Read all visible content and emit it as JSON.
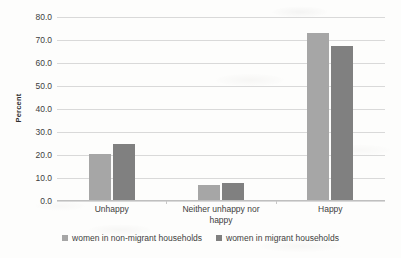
{
  "chart_data": {
    "type": "bar",
    "title": "",
    "xlabel": "",
    "ylabel": "Percent",
    "ylim": [
      0,
      80
    ],
    "ytick_step": 10,
    "ytick_labels": [
      "0.0",
      "10.0",
      "20.0",
      "30.0",
      "40.0",
      "50.0",
      "60.0",
      "70.0",
      "80.0"
    ],
    "grid": true,
    "legend_position": "bottom-center",
    "categories": [
      "Unhappy",
      "Neither unhappy nor happy",
      "Happy"
    ],
    "category_display_lines": [
      [
        "Unhappy"
      ],
      [
        "Neither unhappy nor",
        "happy"
      ],
      [
        "Happy"
      ]
    ],
    "series": [
      {
        "name": "women in non-migrant households",
        "color": "#a6a6a6",
        "values": [
          19.8,
          6.4,
          72.7
        ]
      },
      {
        "name": "women in migrant households",
        "color": "#808080",
        "values": [
          24.3,
          7.4,
          67.0
        ]
      }
    ]
  }
}
